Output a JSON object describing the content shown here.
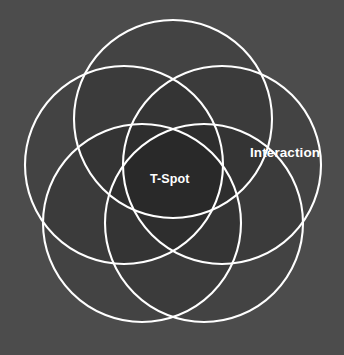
{
  "diagram": {
    "kind": "five-set-venn",
    "background_color": "#4c4c4c",
    "stroke_color": "#ffffff",
    "fill_color": "#d9d9d9",
    "single_overlap_color": "#a8a8a8",
    "double_overlap_color": "#808080",
    "triple_overlap_color": "#5d5d5d",
    "center_color": "#4e4e4e",
    "label_color": "#ffffff",
    "center": {
      "x": 173,
      "y": 181
    },
    "circle_radius": 99,
    "ring_radius": 52,
    "circle_count": 5,
    "circles": [
      {
        "name": "set-top",
        "cx": 173,
        "cy": 119,
        "r": 99,
        "angle_deg": -90
      },
      {
        "name": "set-upper-right",
        "cx": 222,
        "cy": 165,
        "r": 99,
        "angle_deg": -18
      },
      {
        "name": "set-lower-right",
        "cx": 204,
        "cy": 223,
        "r": 99,
        "angle_deg": 54
      },
      {
        "name": "set-lower-left",
        "cx": 142,
        "cy": 223,
        "r": 99,
        "angle_deg": 126
      },
      {
        "name": "set-upper-left",
        "cx": 124,
        "cy": 165,
        "r": 99,
        "angle_deg": 198
      }
    ],
    "labels": {
      "interaction": "Interaction",
      "t_spot": "T-Spot"
    }
  }
}
